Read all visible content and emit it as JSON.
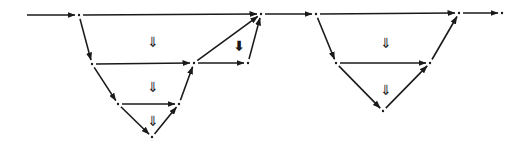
{
  "diagram": {
    "type": "directed-graph",
    "colors": {
      "stroke": "#1a1a1a",
      "background": "#ffffff"
    },
    "nodes": [
      {
        "id": "S",
        "x": 27,
        "y": 15,
        "visible": false
      },
      {
        "id": "A",
        "x": 79,
        "y": 15
      },
      {
        "id": "B",
        "x": 92,
        "y": 64
      },
      {
        "id": "C",
        "x": 118,
        "y": 104
      },
      {
        "id": "D",
        "x": 152,
        "y": 137
      },
      {
        "id": "E",
        "x": 179,
        "y": 104
      },
      {
        "id": "F",
        "x": 194,
        "y": 63
      },
      {
        "id": "G",
        "x": 248,
        "y": 63
      },
      {
        "id": "H",
        "x": 261,
        "y": 14
      },
      {
        "id": "I",
        "x": 316,
        "y": 14
      },
      {
        "id": "J",
        "x": 336,
        "y": 63
      },
      {
        "id": "K",
        "x": 383,
        "y": 111
      },
      {
        "id": "L",
        "x": 430,
        "y": 63
      },
      {
        "id": "M",
        "x": 459,
        "y": 13
      },
      {
        "id": "N",
        "x": 502,
        "y": 13
      }
    ],
    "edges": [
      {
        "from": "S",
        "to": "A"
      },
      {
        "from": "A",
        "to": "H"
      },
      {
        "from": "A",
        "to": "B"
      },
      {
        "from": "B",
        "to": "F"
      },
      {
        "from": "B",
        "to": "C"
      },
      {
        "from": "C",
        "to": "E"
      },
      {
        "from": "C",
        "to": "D"
      },
      {
        "from": "D",
        "to": "E"
      },
      {
        "from": "E",
        "to": "F"
      },
      {
        "from": "F",
        "to": "G"
      },
      {
        "from": "F",
        "to": "H"
      },
      {
        "from": "G",
        "to": "H"
      },
      {
        "from": "H",
        "to": "I"
      },
      {
        "from": "I",
        "to": "M"
      },
      {
        "from": "I",
        "to": "J"
      },
      {
        "from": "J",
        "to": "L"
      },
      {
        "from": "J",
        "to": "K"
      },
      {
        "from": "K",
        "to": "L"
      },
      {
        "from": "L",
        "to": "M"
      },
      {
        "from": "M",
        "to": "N"
      }
    ],
    "two_cells": [
      {
        "symbol": "⇓",
        "x": 153,
        "y": 42,
        "bold": false
      },
      {
        "symbol": "⇓",
        "x": 153,
        "y": 87,
        "bold": false
      },
      {
        "symbol": "⇓",
        "x": 153,
        "y": 121,
        "bold": false
      },
      {
        "symbol": "⬇",
        "x": 239,
        "y": 46,
        "bold": true
      },
      {
        "symbol": "⇓",
        "x": 386,
        "y": 43,
        "bold": false
      },
      {
        "symbol": "⇓",
        "x": 386,
        "y": 90,
        "bold": false
      }
    ]
  }
}
